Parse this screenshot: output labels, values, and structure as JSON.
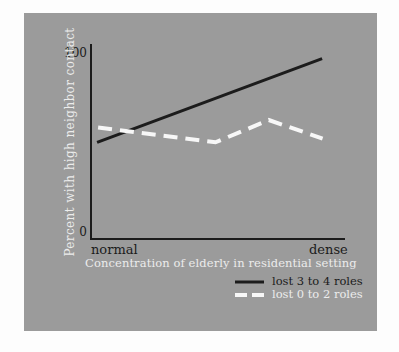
{
  "figure": {
    "page_background": "#fdfdfd",
    "card_color": "#9b9b9b",
    "ink_dark": "#1c1c1c",
    "ink_light": "#ececec",
    "dashed_line_color": "#f7f7f7"
  },
  "axes": {
    "y_tick_top": "100",
    "y_tick_bottom": "0",
    "x_tick_left": "normal",
    "x_tick_right": "dense",
    "x_title": "Concentration of elderly in residential setting",
    "y_title": "Percent with high neighbor contact"
  },
  "legend": [
    {
      "label": "lost 3 to 4 roles",
      "style": "solid",
      "color": "#1c1c1c"
    },
    {
      "label": "lost 0 to 2 roles",
      "style": "dashed",
      "color": "#f7f7f7"
    }
  ],
  "chart_data": {
    "type": "line",
    "title": "",
    "xlabel": "Concentration of elderly in residential setting",
    "ylabel": "Percent with high neighbor contact",
    "x_axis": {
      "type": "continuous",
      "left_end_label": "normal",
      "right_end_label": "dense"
    },
    "ylim": [
      0,
      100
    ],
    "yticks": [
      0,
      100
    ],
    "grid": false,
    "legend_position": "below-right",
    "series": [
      {
        "name": "lost 3 to 4 roles",
        "line_style": "solid",
        "color": "#1c1c1c",
        "points": [
          {
            "x": 0.024,
            "y": 52
          },
          {
            "x": 0.91,
            "y": 97
          }
        ]
      },
      {
        "name": "lost 0 to 2 roles",
        "line_style": "dashed",
        "color": "#f7f7f7",
        "points": [
          {
            "x": 0.028,
            "y": 60
          },
          {
            "x": 0.49,
            "y": 52
          },
          {
            "x": 0.7,
            "y": 64
          },
          {
            "x": 0.912,
            "y": 54
          }
        ]
      }
    ]
  }
}
